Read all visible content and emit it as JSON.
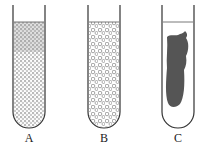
{
  "figure": {
    "tubes": [
      {
        "label": "A",
        "content": "fine dense granular suspension"
      },
      {
        "label": "B",
        "content": "coarse flocculent particles"
      },
      {
        "label": "C",
        "content": "solid dark clot"
      }
    ],
    "colors": {
      "outline": "#333333",
      "clot": "#555555",
      "background": "#ffffff"
    }
  }
}
